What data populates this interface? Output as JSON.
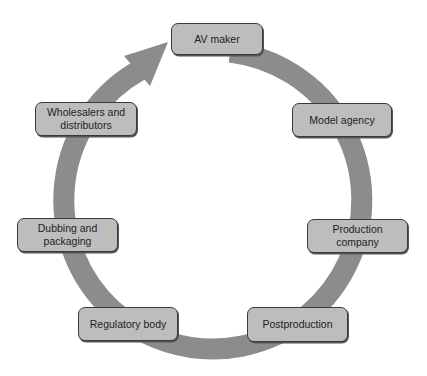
{
  "diagram": {
    "type": "cycle",
    "ring_color": "#8c8c8c",
    "node_fill": "#bdbdbd",
    "node_border": "#3a3a3a",
    "arrow_direction": "clockwise",
    "nodes": [
      {
        "id": "av-maker",
        "label": "AV maker"
      },
      {
        "id": "model-agency",
        "label": "Model agency"
      },
      {
        "id": "production-company",
        "label": "Production company"
      },
      {
        "id": "postproduction",
        "label": "Postproduction"
      },
      {
        "id": "regulatory-body",
        "label": "Regulatory body"
      },
      {
        "id": "dubbing-packaging",
        "label": "Dubbing and packaging"
      },
      {
        "id": "wholesalers-distributors",
        "label": "Wholesalers and distributors"
      }
    ]
  }
}
